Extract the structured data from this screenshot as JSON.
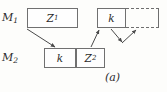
{
  "figure": {
    "caption": "(a)",
    "row_labels": {
      "top": {
        "base": "M",
        "sub": "1"
      },
      "bottom": {
        "base": "M",
        "sub": "2"
      }
    },
    "blocks": {
      "z1": {
        "base": "Z",
        "sub": "1"
      },
      "k_top": {
        "base": "k",
        "sub": ""
      },
      "k_bottom": {
        "base": "k",
        "sub": ""
      },
      "z2": {
        "base": "Z",
        "sub": "2"
      },
      "dashed": {
        "base": "",
        "sub": ""
      }
    },
    "colors": {
      "stroke": "#707070",
      "text": "#2b2b2b",
      "background": "#fdfdfb"
    }
  }
}
